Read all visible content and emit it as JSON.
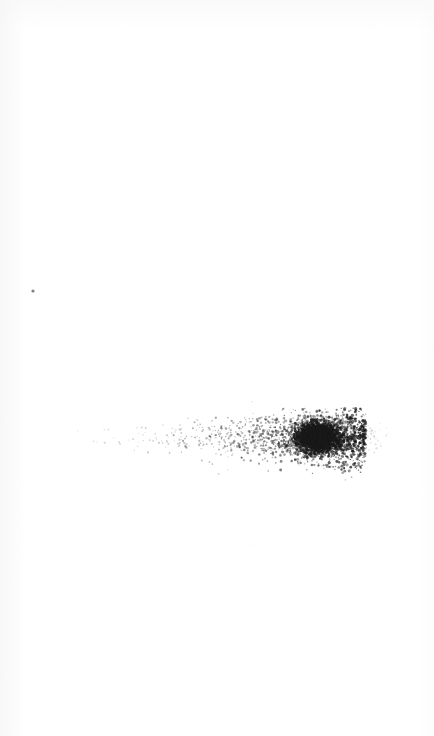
{
  "page": {
    "kind": "scanned-blank-page",
    "width": 434,
    "height": 736,
    "background_color": "#fefefe",
    "paper_tone_color": "#f7f7f8",
    "has_text": false,
    "has_ui_chrome": false,
    "visible_text": "",
    "description": "Blank scanned page bearing no text or printed content; only scanner noise and ink/toner artifacts are visible."
  },
  "artifacts": {
    "ink_color": "#1a1a1a",
    "items": [
      {
        "id": "isolated-speck",
        "label": "isolated speck",
        "shape": "dot",
        "center_x": 33,
        "center_y": 291,
        "radius": 1.6,
        "opacity": 0.55
      },
      {
        "id": "speckle-smear",
        "label": "horizontal toner speckle smear",
        "shape": "speckle-band",
        "x_start": 65,
        "x_end": 366,
        "y_start": 410,
        "y_end": 470,
        "baseline_y": 438,
        "dot_count": 2600,
        "seed": 20240517,
        "density_profile": "increases left to right",
        "core": {
          "label": "dense dark blob",
          "center_x": 318,
          "center_y": 437,
          "radius_x": 30,
          "radius_y": 21,
          "dot_count": 3400,
          "seed": 777312
        }
      }
    ]
  }
}
